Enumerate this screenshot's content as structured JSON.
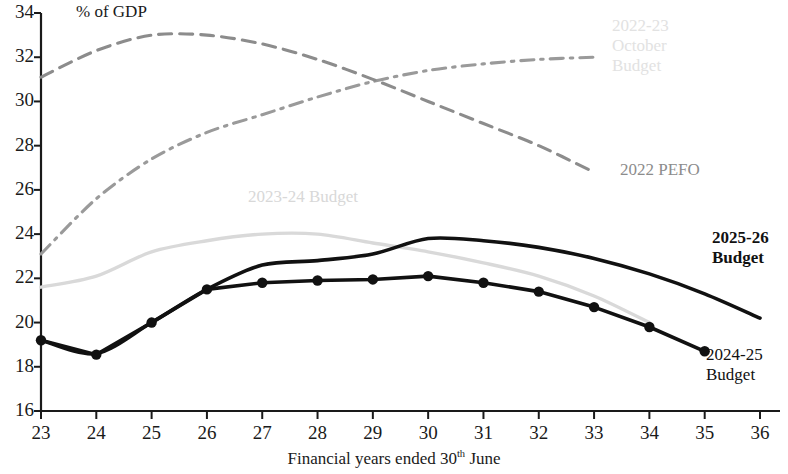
{
  "unit_label": "% of GDP",
  "x_axis_title_pre": "Financial years ended 30",
  "x_axis_title_sup": "th",
  "x_axis_title_post": " June",
  "colors": {
    "series_2025_26": "#111111",
    "series_2024_25": "#111111",
    "series_2023_24": "#d9d9d9",
    "series_2022_pefo": "#8c8c8c",
    "series_2022_23_oct": "#9a9a9a",
    "axis": "#1a1a1a"
  },
  "annotations": {
    "oct_budget_line1": "2022-23",
    "oct_budget_line2": "October",
    "oct_budget_line3": "Budget",
    "pefo": "2022 PEFO",
    "budget_2023_24": "2023-24 Budget",
    "budget_2025_26_line1": "2025-26",
    "budget_2025_26_line2": "Budget",
    "budget_2024_25_line1": "2024-25",
    "budget_2024_25_line2": "Budget"
  },
  "chart_data": {
    "type": "line",
    "title": "",
    "subtitle": "",
    "xlabel": "Financial years ended 30th June",
    "ylabel": "% of GDP",
    "xlim": [
      23,
      36
    ],
    "ylim": [
      16,
      34
    ],
    "x_ticks": [
      23,
      24,
      25,
      26,
      27,
      28,
      29,
      30,
      31,
      32,
      33,
      34,
      35,
      36
    ],
    "y_ticks": [
      16,
      18,
      20,
      22,
      24,
      26,
      28,
      30,
      32,
      34
    ],
    "grid": false,
    "legend": "inline-annotations",
    "series": [
      {
        "name": "2022-23 October Budget",
        "style": "dash-dot",
        "color": "#9a9a9a",
        "markers": false,
        "x": [
          23,
          24,
          25,
          26,
          27,
          28,
          29,
          30,
          31,
          32,
          33
        ],
        "values": [
          23.1,
          25.6,
          27.4,
          28.6,
          29.4,
          30.2,
          30.9,
          31.4,
          31.7,
          31.9,
          32.0
        ]
      },
      {
        "name": "2022 PEFO",
        "style": "dashed",
        "color": "#8c8c8c",
        "markers": false,
        "x": [
          23,
          24,
          25,
          26,
          27,
          28,
          29,
          30,
          31,
          32,
          33
        ],
        "values": [
          31.1,
          32.3,
          33.0,
          33.0,
          32.6,
          31.9,
          31.0,
          30.0,
          29.0,
          28.0,
          26.8
        ]
      },
      {
        "name": "2023-24 Budget",
        "style": "solid",
        "color": "#d9d9d9",
        "markers": false,
        "x": [
          23,
          24,
          25,
          26,
          27,
          28,
          29,
          30,
          31,
          32,
          33,
          34
        ],
        "values": [
          21.6,
          22.1,
          23.2,
          23.7,
          24.0,
          24.0,
          23.6,
          23.2,
          22.7,
          22.1,
          21.2,
          20.0
        ]
      },
      {
        "name": "2025-26 Budget",
        "style": "solid",
        "color": "#111111",
        "markers": false,
        "x": [
          23,
          24,
          25,
          26,
          27,
          28,
          29,
          30,
          31,
          32,
          33,
          34,
          35,
          36
        ],
        "values": [
          19.2,
          18.6,
          20.0,
          21.5,
          22.6,
          22.8,
          23.1,
          23.8,
          23.7,
          23.4,
          22.9,
          22.2,
          21.3,
          20.2
        ]
      },
      {
        "name": "2024-25 Budget",
        "style": "solid-markers",
        "color": "#111111",
        "markers": true,
        "x": [
          23,
          24,
          25,
          26,
          27,
          28,
          29,
          30,
          31,
          32,
          33,
          34,
          35
        ],
        "values": [
          19.2,
          18.55,
          20.0,
          21.5,
          21.8,
          21.9,
          21.95,
          22.1,
          21.8,
          21.4,
          20.7,
          19.8,
          18.7
        ]
      }
    ]
  }
}
